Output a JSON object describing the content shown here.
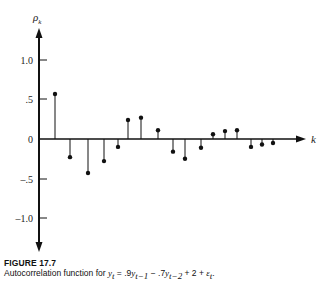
{
  "chart_data": {
    "type": "stem",
    "title": "Autocorrelation function",
    "xlabel": "k",
    "ylabel": "ρ_k",
    "ylim": [
      -1.3,
      1.3
    ],
    "grid": false,
    "legend": null,
    "y_ticks": [
      1.0,
      0.5,
      0,
      -0.5,
      -1.0
    ],
    "y_tick_labels": [
      "1.0",
      ".5",
      "0",
      "–.5",
      "–1.0"
    ],
    "x": [
      1,
      2,
      3,
      4,
      5,
      6,
      7,
      8,
      9,
      10,
      11,
      12,
      13,
      14,
      15,
      16,
      17
    ],
    "values": [
      0.57,
      -0.23,
      -0.43,
      -0.28,
      -0.1,
      0.24,
      0.27,
      0.11,
      -0.16,
      -0.25,
      -0.11,
      0.06,
      0.1,
      0.11,
      -0.1,
      -0.07,
      -0.05
    ],
    "x_positions_px": [
      55,
      70,
      88,
      104,
      118,
      128,
      141,
      158,
      173,
      185,
      201,
      213,
      225,
      237,
      251,
      262,
      273
    ]
  },
  "axis": {
    "y_title": "ρ",
    "y_title_sub": "k",
    "x_title": "k",
    "tick_labels": [
      "1.0",
      ".5",
      "0",
      "–.5",
      "–1.0"
    ]
  },
  "caption": {
    "figure_number": "FIGURE 17.7",
    "text_prefix": "Autocorrelation function for ",
    "equation": {
      "lhs": "y",
      "lhs_sub": "t",
      "term1": " = .9",
      "y1": "y",
      "y1_sub": "t−1",
      "term2": " − .7",
      "y2": "y",
      "y2_sub": "t−2",
      "term3": " + 2 + ",
      "eps": "ε",
      "eps_sub": "t",
      "end": "."
    }
  },
  "colors": {
    "ink": "#111111",
    "background": "#ffffff"
  }
}
